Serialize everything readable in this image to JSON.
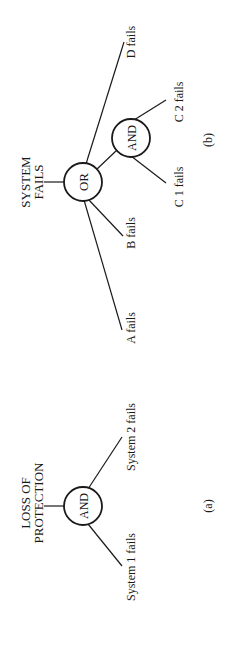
{
  "diagram": {
    "type": "fault-tree",
    "orientation": "rotated 90 degrees counter-clockwise",
    "panels": [
      {
        "id": "a",
        "caption": "(a)",
        "top_event": {
          "line1": "LOSS OF",
          "line2": "PROTECTION"
        },
        "gate": "AND",
        "inputs": [
          "System 1 fails",
          "System 2 fails"
        ]
      },
      {
        "id": "b",
        "caption": "(b)",
        "top_event": {
          "line1": "SYSTEM",
          "line2": "FAILS"
        },
        "gate": "OR",
        "inputs": [
          "A fails",
          "B fails",
          "C-gate",
          "D fails"
        ],
        "sub_gate": {
          "gate": "AND",
          "inputs": [
            "C 1 fails",
            "C 2 fails"
          ]
        }
      }
    ]
  },
  "labels": {
    "a_top_line1": "LOSS OF",
    "a_top_line2": "PROTECTION",
    "a_gate": "AND",
    "a_input_1": "System 1 fails",
    "a_input_2": "System 2 fails",
    "a_caption": "(a)",
    "b_top_line1": "SYSTEM",
    "b_top_line2": "FAILS",
    "b_gate_or": "OR",
    "b_gate_and": "AND",
    "b_input_a": "A fails",
    "b_input_b": "B fails",
    "b_input_c1": "C 1 fails",
    "b_input_c2": "C 2 fails",
    "b_input_d": "D fails",
    "b_caption": "(b)"
  },
  "colors": {
    "ink": "#1a1a1a",
    "background": "#ffffff"
  }
}
